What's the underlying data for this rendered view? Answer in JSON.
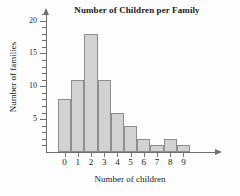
{
  "chart_data": {
    "type": "bar",
    "title": "Number of Children per Family",
    "xlabel": "Number of children",
    "ylabel": "Number of families",
    "categories": [
      "0",
      "1",
      "2",
      "3",
      "4",
      "5",
      "6",
      "7",
      "8",
      "9"
    ],
    "values": [
      8,
      11,
      18,
      11,
      6,
      4,
      2,
      1,
      2,
      1
    ],
    "ylim": [
      0,
      21
    ],
    "xlim": [
      -0.5,
      9.5
    ],
    "y_major_ticks": [
      5,
      10,
      15,
      20
    ],
    "y_minor_ticks": [
      1,
      2,
      3,
      4,
      6,
      7,
      8,
      9,
      11,
      12,
      13,
      14,
      16,
      17,
      18,
      19,
      21
    ],
    "y_tick_labels": [
      "5",
      "10",
      "15",
      "20"
    ],
    "grid": false,
    "legend": false,
    "bar_fill_color": "#d2d2d2",
    "bar_edge_color": "#8e8e8e",
    "axis_color": "#6e6e6e",
    "background_color": "#fdfdfd",
    "bars_contiguous": true
  }
}
